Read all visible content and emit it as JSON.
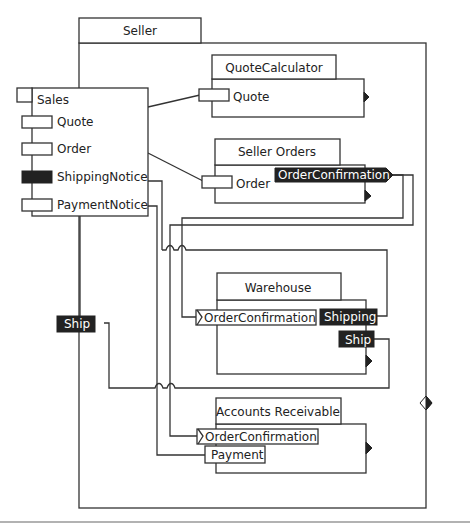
{
  "diagram": {
    "container": {
      "title": "Seller"
    },
    "sales": {
      "title": "Sales",
      "ports": [
        {
          "label": "Quote",
          "filled": false
        },
        {
          "label": "Order",
          "filled": false
        },
        {
          "label": "ShippingNotice",
          "filled": true
        },
        {
          "label": "PaymentNotice",
          "filled": false
        }
      ]
    },
    "quote_calculator": {
      "title": "QuoteCalculator",
      "in_port": "Quote"
    },
    "seller_orders": {
      "title": "Seller Orders",
      "in_port": "Order",
      "out_port": "OrderConfirmation"
    },
    "warehouse": {
      "title": "Warehouse",
      "in_port": "OrderConfirmation",
      "out_ports": [
        "Shipping",
        "Ship"
      ]
    },
    "accounts_receivable": {
      "title": "Accounts Receivable",
      "in_ports": [
        "OrderConfirmation",
        "Payment"
      ]
    },
    "external_port": {
      "label": "Ship"
    },
    "colors": {
      "line": "#333333",
      "filled_port": "#222222",
      "background": "#ffffff"
    }
  }
}
